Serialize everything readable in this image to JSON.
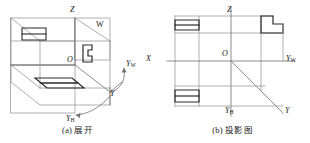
{
  "figure": {
    "kind": "descriptive-geometry-projection-figure",
    "background": "#ffffff",
    "line_color": "#2b2b2b",
    "thin_line_color": "#8c8c8c",
    "text_color": "#1a1a1a"
  },
  "panel_a": {
    "caption": "(a) 展开",
    "labels": {
      "z_axis": "Z",
      "origin": "O",
      "w_plane": "W",
      "y_w_axis": "Y",
      "y_w_sub": "W",
      "y_axis": "Y",
      "y_h_axis": "Y",
      "y_h_sub": "H"
    }
  },
  "panel_b": {
    "caption": "(b) 投影图",
    "labels": {
      "z_axis": "Z",
      "origin": "O",
      "x_axis": "X",
      "y_w_axis": "Y",
      "y_w_sub": "W",
      "y_axis": "Y",
      "y_h_axis": "Y",
      "y_h_sub": "H"
    }
  }
}
